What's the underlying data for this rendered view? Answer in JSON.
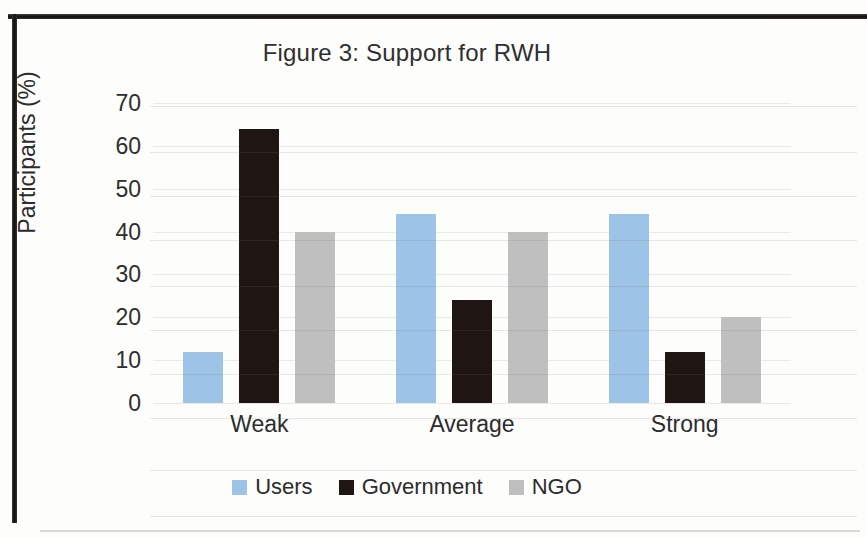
{
  "figure": {
    "title": "Figure 3: Support for RWH"
  },
  "axes": {
    "y_title": "Participants (%)",
    "y_ticks": [
      "70",
      "60",
      "50",
      "40",
      "30",
      "20",
      "10",
      "0"
    ],
    "x_labels": [
      "Weak",
      "Average",
      "Strong"
    ]
  },
  "legend": {
    "items": [
      {
        "label": "Users",
        "color": "#9dc3e6"
      },
      {
        "label": "Government",
        "color": "#1f1513"
      },
      {
        "label": "NGO",
        "color": "#bfbfbf"
      }
    ]
  },
  "chart_data": {
    "type": "bar",
    "title": "Figure 3: Support for RWH",
    "xlabel": "",
    "ylabel": "Participants (%)",
    "categories": [
      "Weak",
      "Average",
      "Strong"
    ],
    "series": [
      {
        "name": "Users",
        "color": "#9dc3e6",
        "values": [
          12,
          44,
          44
        ]
      },
      {
        "name": "Government",
        "color": "#1f1513",
        "values": [
          64,
          24,
          12
        ]
      },
      {
        "name": "NGO",
        "color": "#bfbfbf",
        "values": [
          40,
          40,
          20
        ]
      }
    ],
    "ylim": [
      0,
      70
    ],
    "ytick_step": 10,
    "grid": true,
    "legend_position": "bottom"
  }
}
